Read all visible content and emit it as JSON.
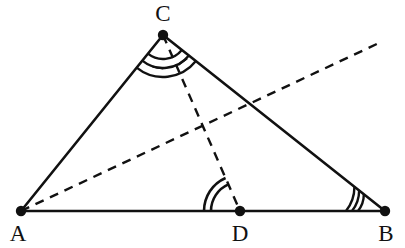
{
  "figure": {
    "kind": "euclidean-geometry-diagram",
    "canvas": {
      "width": 405,
      "height": 248,
      "background": "#ffffff"
    },
    "stroke_color": "#111111",
    "points": {
      "A": {
        "label": "A",
        "x": 21,
        "y": 211,
        "label_x": 18,
        "label_y": 233
      },
      "B": {
        "label": "B",
        "x": 385,
        "y": 211,
        "label_x": 386,
        "label_y": 233
      },
      "C": {
        "label": "C",
        "x": 163,
        "y": 35,
        "label_x": 163,
        "label_y": 13
      },
      "D": {
        "label": "D",
        "x": 240,
        "y": 211,
        "label_x": 240,
        "label_y": 233
      }
    },
    "solid_segments": [
      {
        "name": "side-AC",
        "from": "A",
        "to": "C",
        "x1": 21,
        "y1": 211,
        "x2": 163,
        "y2": 35
      },
      {
        "name": "side-CB",
        "from": "C",
        "to": "B",
        "x1": 163,
        "y1": 35,
        "x2": 385,
        "y2": 211
      },
      {
        "name": "side-AB",
        "from": "A",
        "to": "B",
        "x1": 21,
        "y1": 211,
        "x2": 385,
        "y2": 211
      }
    ],
    "dashed_segments": [
      {
        "name": "cevian-CD",
        "from": "C",
        "to": "D",
        "x1": 163,
        "y1": 35,
        "x2": 240,
        "y2": 211
      },
      {
        "name": "ray-from-A",
        "from": "A",
        "to": "ray-end",
        "x1": 21,
        "y1": 211,
        "x2": 381,
        "y2": 42,
        "crosses_side_CB_at": {
          "x": 248,
          "y": 104
        }
      }
    ],
    "angle_marks": [
      {
        "name": "angle-ACD",
        "at": "C",
        "arc_count": 3,
        "tick": true,
        "tick_count": 1
      },
      {
        "name": "angle-DCB",
        "at": "C",
        "arc_count": 3,
        "tick": true,
        "tick_count": 1
      },
      {
        "name": "angle-CDA",
        "at": "D",
        "arc_count": 2,
        "tick": false
      },
      {
        "name": "angle-ABC",
        "at": "B",
        "arc_count": 3,
        "tick": false
      }
    ]
  }
}
